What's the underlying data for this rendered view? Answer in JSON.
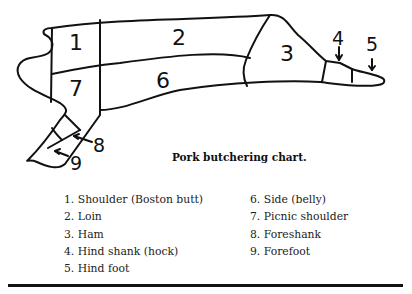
{
  "diagram": {
    "labels": [
      "1",
      "2",
      "3",
      "4",
      "5",
      "6",
      "7",
      "8",
      "9"
    ]
  },
  "caption": "Pork butchering chart.",
  "legend": {
    "column1": [
      "1. Shoulder (Boston butt)",
      "2. Loin",
      "3. Ham",
      "4. Hind shank (hock)",
      "5. Hind foot"
    ],
    "column2": [
      "6. Side (belly)",
      "7. Picnic shoulder",
      "8. Foreshank",
      "9. Forefoot"
    ]
  }
}
